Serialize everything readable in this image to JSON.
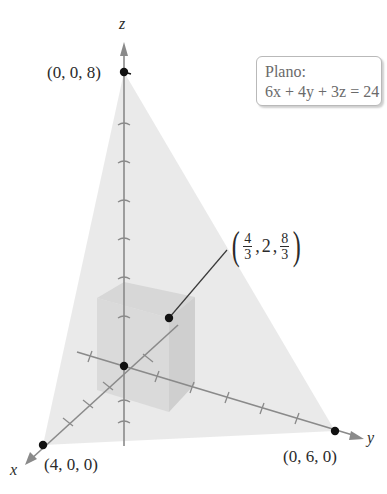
{
  "figure": {
    "axes": {
      "x_label": "x",
      "y_label": "y",
      "z_label": "z"
    },
    "plane_label": {
      "title": "Plano:",
      "equation": "6x + 4y + 3z = 24"
    },
    "intercepts": [
      {
        "name": "z-intercept",
        "label": "(0, 0, 8)"
      },
      {
        "name": "x-intercept",
        "label": "(4, 0, 0)"
      },
      {
        "name": "y-intercept",
        "label": "(0, 6, 0)"
      }
    ],
    "box_corner": {
      "label_open": "(",
      "x_num": "4",
      "x_den": "3",
      "y_val": "2",
      "z_num": "8",
      "z_den": "3",
      "label_close": ")",
      "sep": ","
    },
    "colors": {
      "plane_fill": "#e6e6e6",
      "box_fill": "#cfcfcf",
      "axis": "#8a8a8a",
      "point": "#111111",
      "label_box_border": "#b9b9b9",
      "plane_text": "#6a6a6a"
    }
  }
}
